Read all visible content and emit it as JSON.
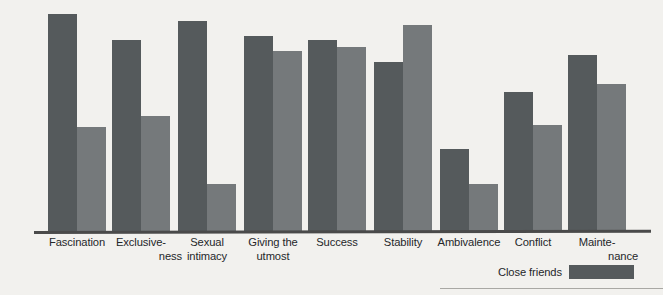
{
  "chart_data": {
    "type": "bar",
    "title": "",
    "subtitle": "",
    "xlabel": "",
    "ylabel": "",
    "ylim": [
      0,
      100
    ],
    "grid": false,
    "legend_position": "bottom-right",
    "categories": [
      "Fascination",
      "Exclusiveness",
      "Sexual intimacy",
      "Giving the utmost",
      "Success",
      "Stability",
      "Ambivalence",
      "Conflict",
      "Maintenance"
    ],
    "category_lines": [
      [
        "Fascination"
      ],
      [
        "Exclusive-",
        "ness"
      ],
      [
        "Sexual",
        "intimacy"
      ],
      [
        "Giving the",
        "utmost"
      ],
      [
        "Success"
      ],
      [
        "Stability"
      ],
      [
        "Ambivalence"
      ],
      [
        "Conflict"
      ],
      [
        "Mainte-",
        "nance"
      ]
    ],
    "series": [
      {
        "name": "Close friends",
        "color": "#555a5c",
        "values": [
          100,
          88,
          97,
          90,
          88,
          78,
          38,
          64,
          81
        ]
      },
      {
        "name": "",
        "color": "#75797b",
        "values": [
          48,
          53,
          22,
          83,
          85,
          95,
          22,
          49,
          68
        ]
      }
    ],
    "annotations": []
  },
  "legend": {
    "label": "Close friends",
    "swatch_color": "#555a5c"
  },
  "colors": {
    "background": "#f2f1ee",
    "axis": "#4a4a4a",
    "series_dark": "#555a5c",
    "series_light": "#75797b",
    "text": "#25272a"
  }
}
